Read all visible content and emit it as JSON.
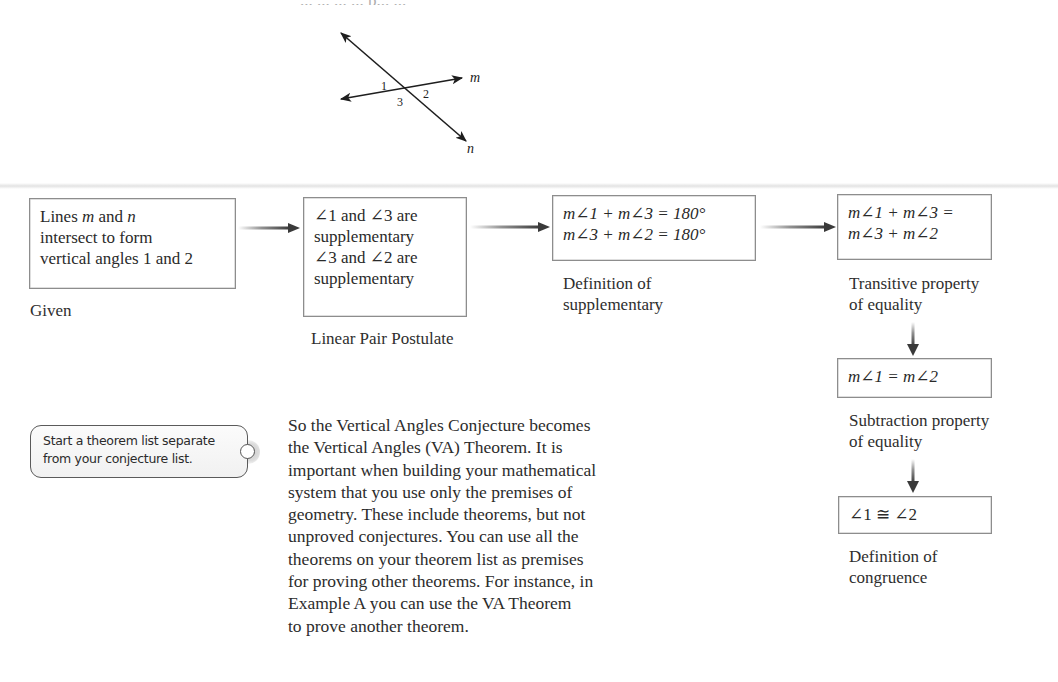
{
  "header": {
    "remnant_text": "... ... ... ... p... ..."
  },
  "diagram": {
    "line_labels": {
      "m": "m",
      "n": "n"
    },
    "angle_labels": [
      "1",
      "3",
      "2"
    ]
  },
  "flowchart": {
    "steps": [
      {
        "statement_lines": [
          "Lines m and n",
          "intersect to form",
          "vertical angles 1 and 2"
        ],
        "reason_lines": [
          "Given"
        ]
      },
      {
        "statement_lines": [
          "∠1 and ∠3 are",
          "supplementary",
          "∠3 and ∠2 are",
          "supplementary"
        ],
        "reason_lines": [
          "Linear Pair Postulate"
        ]
      },
      {
        "statement_lines": [
          "m∠1 + m∠3 = 180°",
          "m∠3 + m∠2 = 180°"
        ],
        "reason_lines": [
          "Definition of",
          "supplementary"
        ]
      },
      {
        "statement_lines": [
          "m∠1 + m∠3 =",
          "m∠3 + m∠2"
        ],
        "reason_lines": [
          "Transitive property",
          "of equality"
        ]
      },
      {
        "statement_lines": [
          "m∠1 = m∠2"
        ],
        "reason_lines": [
          "Subtraction property",
          "of equality"
        ]
      },
      {
        "statement_lines": [
          "∠1 ≅ ∠2"
        ],
        "reason_lines": [
          "Definition of",
          "congruence"
        ]
      }
    ],
    "arrow_color": "#3a3a3a",
    "box_border_color": "#8d8d8d"
  },
  "margin_note": {
    "lines": [
      "Start a theorem list separate",
      "from your conjecture list."
    ]
  },
  "body_text": {
    "lines": [
      "So the Vertical Angles Conjecture becomes",
      "the Vertical Angles (VA) Theorem. It is",
      "important when building your mathematical",
      "system that you use only the premises of",
      "geometry. These include theorems, but not",
      "unproved conjectures. You can use all the",
      "theorems on your theorem list as premises",
      "for proving other theorems. For instance, in",
      "Example A you can use the VA Theorem",
      "to prove another theorem."
    ]
  }
}
